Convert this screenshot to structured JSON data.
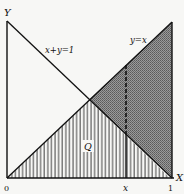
{
  "diagram": {
    "axes": {
      "x_label": "X",
      "y_label": "Y",
      "origin_label": "0",
      "x_tick_label": "x",
      "one_label": "1"
    },
    "lines": [
      {
        "name": "anti-diagonal",
        "label": "x+y=1"
      },
      {
        "name": "diagonal",
        "label": "y=x"
      }
    ],
    "regions": {
      "q_label": "Q",
      "q_fill": "vertical-hatch",
      "upper_right_fill": "gray-dotted"
    },
    "colors": {
      "ink": "#111111",
      "gray_fill": "#8a8a8a",
      "background": "#f7f7f5"
    }
  }
}
